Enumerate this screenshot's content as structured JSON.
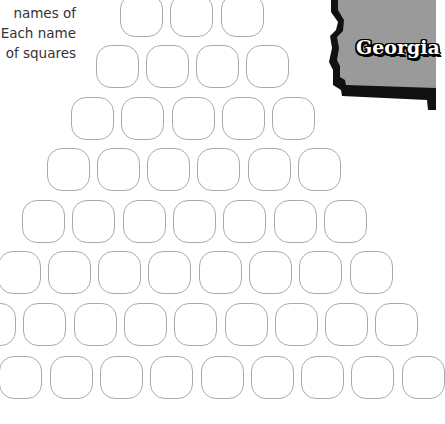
{
  "instructions": {
    "lines": [
      "names of",
      "Each name",
      "of squares"
    ],
    "text_color": "#333333"
  },
  "badge": {
    "label": "Georgia",
    "fill_color": "#9a9a9a",
    "border_color": "#111111",
    "icon": "georgia-state-outline-icon"
  },
  "grid": {
    "stroke_color": "#aaaaaa",
    "square_size": 41,
    "col_pitch": 50.3,
    "rows": [
      {
        "y": -6,
        "x0": 120,
        "count": 3
      },
      {
        "y": 45,
        "x0": 95.5,
        "count": 4
      },
      {
        "y": 97,
        "x0": 71,
        "count": 5
      },
      {
        "y": 148,
        "x0": 46.5,
        "count": 6
      },
      {
        "y": 200,
        "x0": 22,
        "count": 7
      },
      {
        "y": 251,
        "x0": -2.5,
        "count": 8
      },
      {
        "y": 303,
        "x0": -27,
        "count": 9
      },
      {
        "y": 356,
        "x0": -51,
        "count": 10
      }
    ]
  }
}
